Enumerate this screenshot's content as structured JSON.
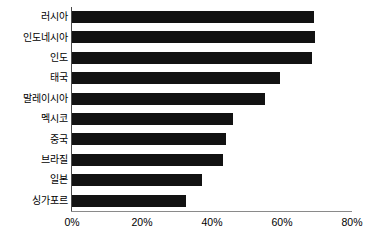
{
  "chart_data": {
    "type": "bar",
    "orientation": "horizontal",
    "title": "",
    "xlabel": "",
    "ylabel": "",
    "categories": [
      "러시아",
      "인도네시아",
      "인도",
      "태국",
      "말레이시아",
      "멕시코",
      "중국",
      "브라질",
      "일본",
      "싱가포르"
    ],
    "values": [
      69,
      69.5,
      68.5,
      59.5,
      55,
      46,
      44,
      43,
      37,
      32.5
    ],
    "value_suffix": "%",
    "xlim": [
      0,
      80
    ],
    "xticks": [
      0,
      20,
      40,
      60,
      80
    ],
    "xtick_labels": [
      "0%",
      "20%",
      "40%",
      "60%",
      "80%"
    ],
    "grid": false,
    "legend": false,
    "bar_color": "#121212",
    "series": [
      {
        "name": "",
        "values": [
          69,
          69.5,
          68.5,
          59.5,
          55,
          46,
          44,
          43,
          37,
          32.5
        ]
      }
    ]
  },
  "axes": {
    "y_axis_color": "#4a4a4a",
    "x_axis_color": "#8a8a8a"
  }
}
